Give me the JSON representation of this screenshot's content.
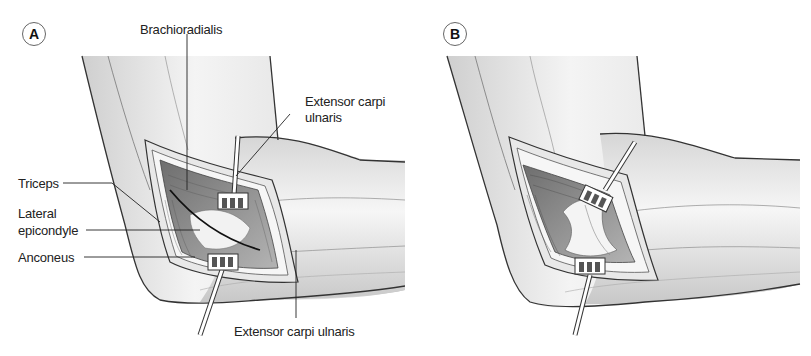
{
  "figure": {
    "panels": [
      {
        "id": "A",
        "badge": "A",
        "labels": {
          "brachioradialis": "Brachioradialis",
          "ecu_top_line1": "Extensor carpi",
          "ecu_top_line2": "ulnaris",
          "triceps": "Triceps",
          "lateral_line1": "Lateral",
          "lateral_line2": "epicondyle",
          "anconeus": "Anconeus",
          "ecu_bottom": "Extensor carpi ulnaris"
        }
      },
      {
        "id": "B",
        "badge": "B"
      }
    ],
    "colors": {
      "skin_light": "#f2f2f2",
      "skin_shade": "#d4d4d4",
      "outline": "#333333",
      "muscle_dark": "#777777",
      "muscle_mid": "#a8a8a8",
      "bone": "#eeeeee",
      "retractor": "#ffffff"
    }
  }
}
